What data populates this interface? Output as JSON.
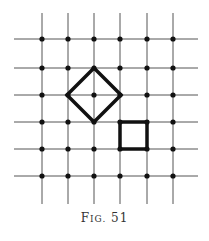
{
  "figure": {
    "caption_prefix": "F",
    "caption_smallcaps": "IG.",
    "caption_number": "51"
  },
  "grid": {
    "columns_x": [
      42,
      68,
      94,
      120,
      147,
      173
    ],
    "rows_y": [
      39,
      68,
      95,
      122,
      149,
      176
    ],
    "line_color": "#555555",
    "dot_color": "#111111"
  },
  "shapes": [
    {
      "type": "diamond",
      "label": "tilted-square",
      "center": [
        94,
        95
      ],
      "half_diagonal": 27,
      "has_inner_cross": true
    },
    {
      "type": "square",
      "label": "axis-aligned-square",
      "corners": [
        [
          120,
          122
        ],
        [
          147,
          149
        ]
      ]
    }
  ]
}
